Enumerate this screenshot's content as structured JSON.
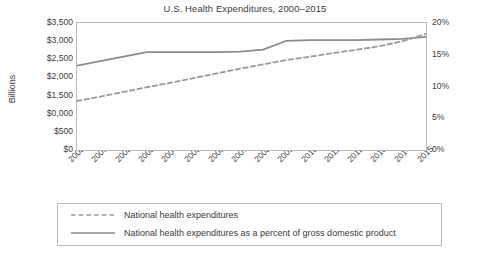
{
  "chart_data": {
    "type": "line",
    "title": "U.S. Health Expenditures, 2000–2015",
    "xlabel": "",
    "ylabel": "Billions",
    "y2label": "",
    "grid": false,
    "legend_position": "bottom",
    "categories": [
      "2000",
      "2001",
      "2002",
      "2003",
      "2004",
      "2005",
      "2006",
      "2007",
      "2008",
      "2009",
      "2010",
      "2011",
      "2012",
      "2013",
      "2014",
      "2015"
    ],
    "ylim": [
      0,
      3500
    ],
    "y2lim": [
      0,
      20
    ],
    "yticks": [
      "$0",
      "$500",
      "$0,000",
      "$1,500",
      "$2,000",
      "$2,500",
      "$3,000",
      "$3,500"
    ],
    "ytick_values": [
      0,
      500,
      1000,
      1500,
      2000,
      2500,
      3000,
      3500
    ],
    "y2ticks": [
      "0%",
      "5%",
      "10%",
      "15%",
      "20%"
    ],
    "y2tick_values": [
      0,
      5,
      10,
      15,
      20
    ],
    "series": [
      {
        "name": "National health expenditures",
        "style": "dashed",
        "axis": "left",
        "color": "#9a9a9a",
        "values": [
          1350,
          1470,
          1600,
          1730,
          1850,
          1980,
          2110,
          2240,
          2360,
          2480,
          2570,
          2670,
          2760,
          2860,
          3000,
          3200
        ]
      },
      {
        "name": "National health expenditures as a percent of gross domestic product",
        "style": "solid",
        "axis": "right",
        "color": "#8c8c8c",
        "values": [
          13.3,
          14.0,
          14.7,
          15.4,
          15.4,
          15.4,
          15.4,
          15.5,
          15.8,
          17.2,
          17.3,
          17.3,
          17.3,
          17.4,
          17.5,
          17.8
        ]
      }
    ],
    "legend": [
      {
        "label": "National health expenditures",
        "style": "dashed"
      },
      {
        "label": "National health expenditures as a percent of gross domestic product",
        "style": "solid"
      }
    ]
  },
  "colors": {
    "axis": "#b9b9b9",
    "text": "#3a3a3a",
    "dashed_series": "#9a9a9a",
    "solid_series": "#8c8c8c",
    "background": "#ffffff"
  }
}
